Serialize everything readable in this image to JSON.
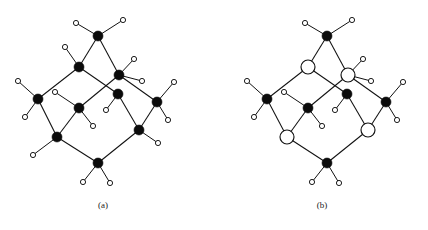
{
  "figure": {
    "background_color": "#ffffff",
    "line_color": "#111111",
    "black_node_color": "#0b0b0b",
    "open_node_color": "#ffffff",
    "width": 428,
    "height": 230
  },
  "panels": [
    {
      "id": "a",
      "caption": "(a)",
      "caption_x": 103,
      "caption_y": 207,
      "description": "Diamond-lattice fragment with all ten framework sites drawn as filled black circles",
      "node_radius_filled": 5.0,
      "node_radius_open": 7.0,
      "leaf_radius": 2.6,
      "nodes": [
        {
          "id": "a-top",
          "x": 98,
          "y": 36,
          "style": "filled"
        },
        {
          "id": "a-upper-left",
          "x": 79,
          "y": 67,
          "style": "filled"
        },
        {
          "id": "a-upper-right",
          "x": 119,
          "y": 75,
          "style": "filled"
        },
        {
          "id": "a-left",
          "x": 38,
          "y": 99,
          "style": "filled"
        },
        {
          "id": "a-mid-left",
          "x": 79,
          "y": 108,
          "style": "filled"
        },
        {
          "id": "a-mid-right",
          "x": 118,
          "y": 94,
          "style": "filled"
        },
        {
          "id": "a-right",
          "x": 157,
          "y": 102,
          "style": "filled"
        },
        {
          "id": "a-lower-left",
          "x": 57,
          "y": 137,
          "style": "filled"
        },
        {
          "id": "a-lower-right",
          "x": 139,
          "y": 130,
          "style": "filled"
        },
        {
          "id": "a-bottom",
          "x": 98,
          "y": 163,
          "style": "filled"
        }
      ],
      "edges": [
        [
          "a-top",
          "a-upper-left"
        ],
        [
          "a-top",
          "a-upper-right"
        ],
        [
          "a-upper-left",
          "a-left"
        ],
        [
          "a-upper-left",
          "a-mid-right"
        ],
        [
          "a-upper-right",
          "a-mid-left"
        ],
        [
          "a-upper-right",
          "a-right"
        ],
        [
          "a-left",
          "a-lower-left"
        ],
        [
          "a-mid-left",
          "a-lower-left"
        ],
        [
          "a-mid-right",
          "a-lower-right"
        ],
        [
          "a-right",
          "a-lower-right"
        ],
        [
          "a-lower-left",
          "a-bottom"
        ],
        [
          "a-lower-right",
          "a-bottom"
        ]
      ],
      "leaves": [
        {
          "parent": "a-top",
          "x": 76,
          "y": 23
        },
        {
          "parent": "a-top",
          "x": 123,
          "y": 20
        },
        {
          "parent": "a-upper-left",
          "x": 65,
          "y": 47
        },
        {
          "parent": "a-upper-right",
          "x": 134,
          "y": 59
        },
        {
          "parent": "a-upper-right",
          "x": 142,
          "y": 81
        },
        {
          "parent": "a-left",
          "x": 18,
          "y": 81
        },
        {
          "parent": "a-left",
          "x": 25,
          "y": 117
        },
        {
          "parent": "a-mid-left",
          "x": 55,
          "y": 92
        },
        {
          "parent": "a-mid-left",
          "x": 93,
          "y": 126
        },
        {
          "parent": "a-mid-right",
          "x": 106,
          "y": 110
        },
        {
          "parent": "a-right",
          "x": 174,
          "y": 82
        },
        {
          "parent": "a-right",
          "x": 168,
          "y": 120
        },
        {
          "parent": "a-lower-left",
          "x": 33,
          "y": 155
        },
        {
          "parent": "a-lower-right",
          "x": 158,
          "y": 143
        },
        {
          "parent": "a-bottom",
          "x": 83,
          "y": 182
        },
        {
          "parent": "a-bottom",
          "x": 110,
          "y": 183
        }
      ]
    },
    {
      "id": "b",
      "caption": "(b)",
      "caption_x": 322,
      "caption_y": 207,
      "description": "Same lattice fragment with four sites substituted, drawn as large open circles",
      "node_radius_filled": 5.0,
      "node_radius_open": 7.0,
      "leaf_radius": 2.6,
      "nodes": [
        {
          "id": "b-top",
          "x": 327,
          "y": 36,
          "style": "filled"
        },
        {
          "id": "b-upper-left",
          "x": 308,
          "y": 67,
          "style": "open"
        },
        {
          "id": "b-upper-right",
          "x": 348,
          "y": 75,
          "style": "open"
        },
        {
          "id": "b-left",
          "x": 267,
          "y": 99,
          "style": "filled"
        },
        {
          "id": "b-mid-left",
          "x": 308,
          "y": 108,
          "style": "filled"
        },
        {
          "id": "b-mid-right",
          "x": 347,
          "y": 94,
          "style": "filled"
        },
        {
          "id": "b-right",
          "x": 386,
          "y": 102,
          "style": "filled"
        },
        {
          "id": "b-lower-left",
          "x": 287,
          "y": 137,
          "style": "open"
        },
        {
          "id": "b-lower-right",
          "x": 368,
          "y": 130,
          "style": "open"
        },
        {
          "id": "b-bottom",
          "x": 327,
          "y": 163,
          "style": "filled"
        }
      ],
      "edges": [
        [
          "b-top",
          "b-upper-left"
        ],
        [
          "b-top",
          "b-upper-right"
        ],
        [
          "b-upper-left",
          "b-left"
        ],
        [
          "b-upper-left",
          "b-mid-right"
        ],
        [
          "b-upper-right",
          "b-mid-left"
        ],
        [
          "b-upper-right",
          "b-right"
        ],
        [
          "b-left",
          "b-lower-left"
        ],
        [
          "b-mid-left",
          "b-lower-left"
        ],
        [
          "b-mid-right",
          "b-lower-right"
        ],
        [
          "b-right",
          "b-lower-right"
        ],
        [
          "b-lower-left",
          "b-bottom"
        ],
        [
          "b-lower-right",
          "b-bottom"
        ]
      ],
      "leaves": [
        {
          "parent": "b-top",
          "x": 305,
          "y": 23
        },
        {
          "parent": "b-top",
          "x": 352,
          "y": 20
        },
        {
          "parent": "b-upper-right",
          "x": 363,
          "y": 59
        },
        {
          "parent": "b-upper-right",
          "x": 371,
          "y": 81
        },
        {
          "parent": "b-left",
          "x": 247,
          "y": 81
        },
        {
          "parent": "b-left",
          "x": 254,
          "y": 117
        },
        {
          "parent": "b-mid-left",
          "x": 284,
          "y": 92
        },
        {
          "parent": "b-mid-left",
          "x": 322,
          "y": 126
        },
        {
          "parent": "b-mid-right",
          "x": 335,
          "y": 110
        },
        {
          "parent": "b-right",
          "x": 403,
          "y": 82
        },
        {
          "parent": "b-right",
          "x": 397,
          "y": 120
        },
        {
          "parent": "b-bottom",
          "x": 312,
          "y": 182
        },
        {
          "parent": "b-bottom",
          "x": 339,
          "y": 183
        }
      ]
    }
  ]
}
